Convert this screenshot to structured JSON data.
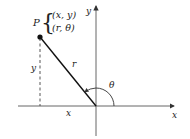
{
  "diagram": {
    "point": {
      "name": "P",
      "cartesian": "(x, y)",
      "polar": "(r, θ)"
    },
    "labels": {
      "x_axis": "x",
      "y_axis": "y",
      "x_length": "x",
      "y_length": "y",
      "radius": "r",
      "angle": "θ"
    },
    "colors": {
      "line": "#222222",
      "axis": "#555555",
      "background": "#ffffff"
    }
  }
}
